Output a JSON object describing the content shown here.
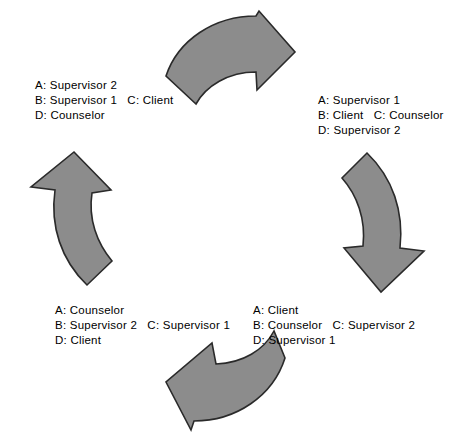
{
  "diagram": {
    "type": "cyclical-rotation-diagram",
    "arrow_color": "#8c8c8c",
    "arrow_outline_color": "#2a2a2a",
    "background_color": "#ffffff",
    "arrows": [
      {
        "name": "top-arrow",
        "direction": "clockwise-right"
      },
      {
        "name": "right-arrow",
        "direction": "clockwise-down"
      },
      {
        "name": "bottom-arrow",
        "direction": "clockwise-left"
      },
      {
        "name": "left-arrow",
        "direction": "clockwise-up"
      }
    ],
    "labels": {
      "top_left": {
        "line1": "A: Supervisor 2",
        "line2": "B: Supervisor 1   C: Client",
        "line3": "D: Counselor"
      },
      "top_right": {
        "line1": "A: Supervisor 1",
        "line2": "B: Client   C: Counselor",
        "line3": "D: Supervisor 2"
      },
      "bottom_left": {
        "line1": "A: Counselor",
        "line2": "B: Supervisor 2   C: Supervisor 1",
        "line3": "D: Client"
      },
      "bottom_right": {
        "line1": "A: Client",
        "line2": "B: Counselor   C: Supervisor 2",
        "line3": "D: Supervisor 1"
      }
    }
  }
}
